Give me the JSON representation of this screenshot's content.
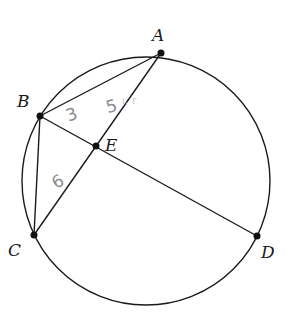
{
  "diagram": {
    "type": "circle-chords",
    "circle": {
      "cx": 146,
      "cy": 180,
      "r": 124
    },
    "points": {
      "A": {
        "x": 161,
        "y": 53,
        "label": "A"
      },
      "B": {
        "x": 40,
        "y": 116,
        "label": "B"
      },
      "C": {
        "x": 34,
        "y": 235,
        "label": "C"
      },
      "D": {
        "x": 257,
        "y": 236,
        "label": "D"
      },
      "E": {
        "x": 96,
        "y": 146,
        "label": "E"
      }
    },
    "segments": [
      "AB",
      "AC",
      "BD",
      "BC"
    ],
    "annotations": {
      "BE": "3",
      "AE": "5",
      "CE": "6",
      "scribble": "ı, r"
    },
    "colors": {
      "line": "#1a1a1a",
      "handwriting": "#8a8a8a"
    }
  }
}
